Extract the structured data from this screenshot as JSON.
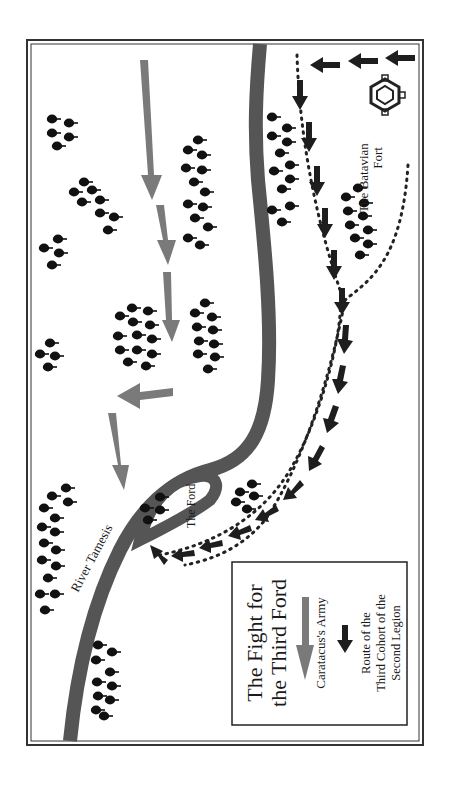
{
  "map": {
    "title_line1": "The Fight for",
    "title_line2": "the Third Ford",
    "labels": {
      "river": "River Tamesis",
      "ford": "The Ford",
      "fort_line1": "The Batavian",
      "fort_line2": "Fort"
    },
    "legend": {
      "caratacus_label": "Caratacus's Army",
      "legion_line1": "Route of the",
      "legion_line2": "Third Cohort of the",
      "legion_line3": "Second Legion"
    },
    "colors": {
      "river": "#555555",
      "caratacus_arrow": "#7a7a7a",
      "legion_arrow": "#1e1e1e",
      "trees": "#111111",
      "border": "#333333",
      "background": "#ffffff"
    },
    "orientation": "rotated 90 degrees counter-clockwise (text reads bottom-to-top)"
  }
}
